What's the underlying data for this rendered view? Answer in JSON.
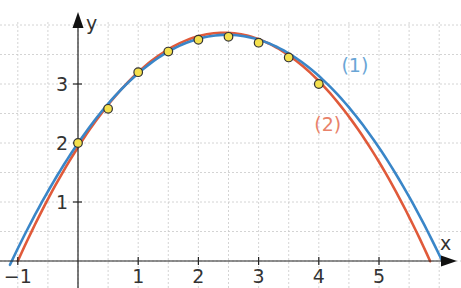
{
  "chart_data": {
    "type": "scatter",
    "title": "",
    "xlabel": "x",
    "ylabel": "y",
    "xlim": [
      -1.2,
      6.3
    ],
    "ylim": [
      -0.45,
      4.4
    ],
    "grid": true,
    "grid_step": 0.5,
    "x_ticks": [
      -1,
      1,
      2,
      3,
      4,
      5
    ],
    "x_tick_labels": [
      "−1",
      "1",
      "2",
      "3",
      "4",
      "5"
    ],
    "y_ticks": [
      1,
      2,
      3
    ],
    "y_tick_labels": [
      "1",
      "2",
      "3"
    ],
    "points": {
      "x": [
        0,
        0.5,
        1,
        1.5,
        2,
        2.5,
        3,
        3.5,
        4
      ],
      "y": [
        2.0,
        2.58,
        3.2,
        3.55,
        3.75,
        3.8,
        3.7,
        3.45,
        3.0
      ],
      "color": "#f4e04d"
    },
    "series": [
      {
        "name": "(1)",
        "type": "line",
        "color": "#3a86c8",
        "formula": "y = -0.3x^2 + 1.485x + 1.9965",
        "coefficients": [
          -0.3,
          1.485,
          1.9965
        ],
        "x_range": [
          -1.13,
          6.05
        ]
      },
      {
        "name": "(2)",
        "type": "line",
        "color": "#e05a3a",
        "formula": "y = -0.33x^2 + 1.6x + 1.93",
        "coefficients": [
          -0.33,
          1.6,
          1.93
        ],
        "x_range": [
          -1.0,
          5.85
        ]
      }
    ],
    "annotations": [
      {
        "text": "(1)",
        "x": 4.6,
        "y": 3.2,
        "color": "#6aa6d6"
      },
      {
        "text": "(2)",
        "x": 4.15,
        "y": 2.2,
        "color": "#e8826a"
      }
    ]
  }
}
